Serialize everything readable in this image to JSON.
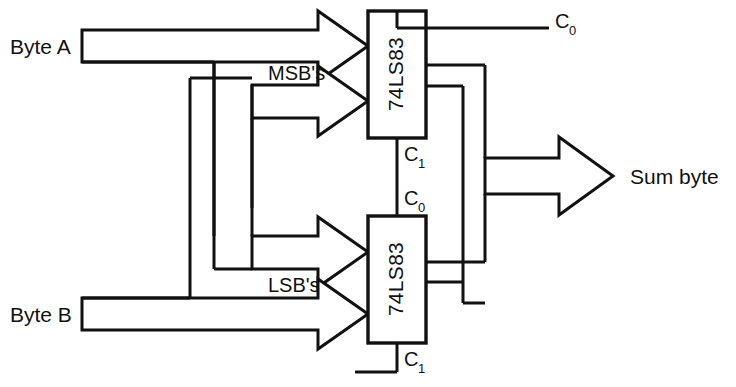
{
  "diagram": {
    "stroke_color": "#111111",
    "background_color": "#ffffff",
    "inputs": [
      {
        "id": "byte-a",
        "label": "Byte A"
      },
      {
        "id": "byte-b",
        "label": "Byte B"
      }
    ],
    "bus_labels": [
      {
        "id": "msb",
        "label": "MSB's"
      },
      {
        "id": "lsb",
        "label": "LSB's"
      }
    ],
    "chips": [
      {
        "id": "chip-msb",
        "label": "74LS83",
        "role": "upper"
      },
      {
        "id": "chip-lsb",
        "label": "74LS83",
        "role": "lower"
      }
    ],
    "carry_labels": [
      {
        "id": "carry-out-top",
        "base": "C",
        "sub": "0",
        "text": "C0"
      },
      {
        "id": "carry-in-top",
        "base": "C",
        "sub": "1",
        "text": "C1"
      },
      {
        "id": "carry-out-bottom",
        "base": "C",
        "sub": "0",
        "text": "C0"
      },
      {
        "id": "carry-in-bottom",
        "base": "C",
        "sub": "1",
        "text": "C1"
      }
    ],
    "outputs": [
      {
        "id": "sum-byte",
        "label": "Sum byte"
      }
    ]
  }
}
